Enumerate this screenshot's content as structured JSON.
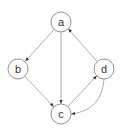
{
  "diagram": {
    "type": "directed-graph",
    "colors": {
      "background": "#ffffff",
      "node_stroke": "#888888",
      "node_fill": "#ffffff",
      "edge": "#999999",
      "arrowhead": "#333333",
      "label": "#333333"
    },
    "nodes": [
      {
        "id": "a",
        "label": "a",
        "cx": 61,
        "cy": 22,
        "r": 10
      },
      {
        "id": "b",
        "label": "b",
        "cx": 18,
        "cy": 69,
        "r": 10
      },
      {
        "id": "c",
        "label": "c",
        "cx": 61,
        "cy": 114,
        "r": 10
      },
      {
        "id": "d",
        "label": "d",
        "cx": 104,
        "cy": 69,
        "r": 10
      }
    ],
    "edges": [
      {
        "from": "a",
        "to": "b",
        "curved": false
      },
      {
        "from": "a",
        "to": "c",
        "curved": false
      },
      {
        "from": "b",
        "to": "c",
        "curved": false
      },
      {
        "from": "d",
        "to": "a",
        "curved": false
      },
      {
        "from": "c",
        "to": "d",
        "curved": false
      },
      {
        "from": "d",
        "to": "c",
        "curved": true
      }
    ]
  }
}
